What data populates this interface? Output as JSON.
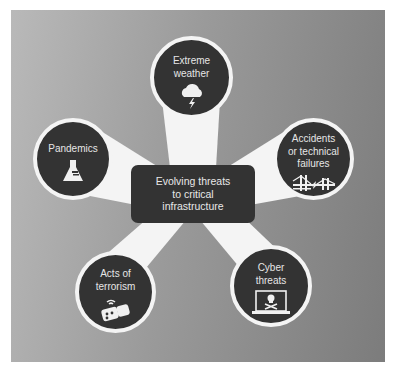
{
  "diagram": {
    "type": "hub-and-spoke",
    "center": {
      "label": "Evolving threats\nto critical\ninfrastructure"
    },
    "nodes": [
      {
        "id": "extreme-weather",
        "label": "Extreme\nweather",
        "icon": "cloud-lightning-icon"
      },
      {
        "id": "accidents",
        "label": "Accidents\nor technical\nfailures",
        "icon": "broken-bridge-icon"
      },
      {
        "id": "cyber-threats",
        "label": "Cyber\nthreats",
        "icon": "laptop-skull-icon"
      },
      {
        "id": "terrorism",
        "label": "Acts of\nterrorism",
        "icon": "bomb-icon"
      },
      {
        "id": "pandemics",
        "label": "Pandemics",
        "icon": "flask-icon"
      }
    ],
    "colors": {
      "node_fill": "#333333",
      "node_ring": "#f4f4f4",
      "connector": "#f4f4f4",
      "background_light": "#b9b9b9",
      "background_dark": "#7c7c7c"
    }
  }
}
